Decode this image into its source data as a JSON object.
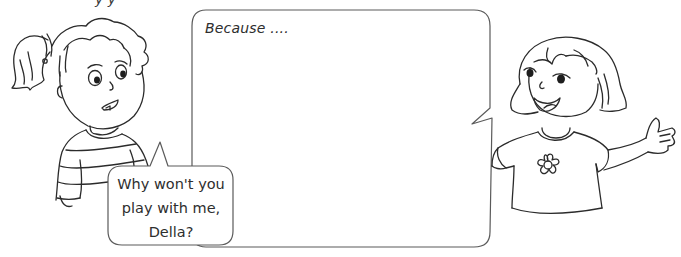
{
  "heading_partial": "y    y",
  "answer_bubble": {
    "prompt": "Because ....",
    "answer_value": "",
    "answer_placeholder": ""
  },
  "question_bubble": {
    "lines": [
      "Why won't you",
      "play with me,",
      "Della?"
    ]
  },
  "characters": {
    "left": "girl-with-ponytail-striped-sweater",
    "right": "della-bob-haircut-flower-shirt"
  },
  "colors": {
    "line": "#2b2b2b",
    "bubble_border": "#5a5a5a",
    "background": "#ffffff"
  }
}
